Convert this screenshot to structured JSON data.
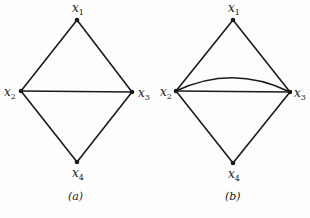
{
  "figures": [
    {
      "caption": "(a)",
      "nodes": [
        {
          "id": "x1",
          "name": "x",
          "sub": "1",
          "x": 77,
          "y": 20
        },
        {
          "id": "x2",
          "name": "x",
          "sub": "2",
          "x": 21,
          "y": 91
        },
        {
          "id": "x3",
          "name": "x",
          "sub": "3",
          "x": 132,
          "y": 92
        },
        {
          "id": "x4",
          "name": "x",
          "sub": "4",
          "x": 77,
          "y": 162
        }
      ],
      "edges": [
        [
          "x1",
          "x2"
        ],
        [
          "x1",
          "x3"
        ],
        [
          "x2",
          "x3"
        ],
        [
          "x2",
          "x4"
        ],
        [
          "x3",
          "x4"
        ]
      ]
    },
    {
      "caption": "(b)",
      "nodes": [
        {
          "id": "x1",
          "name": "x",
          "sub": "1",
          "x": 233,
          "y": 20
        },
        {
          "id": "x2",
          "name": "x",
          "sub": "2",
          "x": 176,
          "y": 91
        },
        {
          "id": "x3",
          "name": "x",
          "sub": "3",
          "x": 290,
          "y": 92
        },
        {
          "id": "x4",
          "name": "x",
          "sub": "4",
          "x": 233,
          "y": 163
        }
      ],
      "edges": [
        [
          "x1",
          "x2"
        ],
        [
          "x1",
          "x3"
        ],
        [
          "x2",
          "x3"
        ],
        [
          "x2",
          "x3",
          "curved"
        ],
        [
          "x2",
          "x4"
        ],
        [
          "x3",
          "x4"
        ]
      ]
    }
  ],
  "colors": {
    "line": "#1a1a1a",
    "background": "#fdfdfd"
  }
}
